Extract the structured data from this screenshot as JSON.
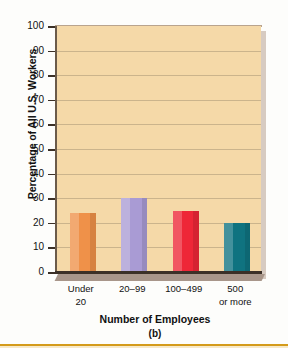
{
  "chart_data": {
    "type": "bar",
    "title": "",
    "categories": [
      "Under 20",
      "20–99",
      "100–499",
      "500 or more"
    ],
    "category_lines": [
      [
        "Under",
        "20"
      ],
      [
        "20–99",
        ""
      ],
      [
        "100–499",
        ""
      ],
      [
        "500",
        "or more"
      ]
    ],
    "values": [
      24,
      30,
      25,
      20
    ],
    "bar_colors": [
      "#ef9149",
      "#a99bd4",
      "#ee2737",
      "#0f7380"
    ],
    "xlabel": "Number of Employees",
    "ylabel": "Percentage of All U.S. Workers",
    "ylim": [
      0,
      100
    ],
    "ytick_step": 10,
    "yticks": [
      100,
      90,
      80,
      70,
      60,
      50,
      40,
      30,
      20,
      10,
      0
    ],
    "ytick_labels": [
      "100",
      "90",
      "80",
      "70",
      "60",
      "50",
      "40",
      "30",
      "20",
      "10",
      "0"
    ],
    "grid": true,
    "legend": "none",
    "caption": "(b)",
    "plot_background": "#f5d9a8",
    "grid_color": "#cbb48c",
    "axis_color": "#3b3027"
  },
  "figure": {
    "caption": "(b)",
    "ylabel": "Percentage of All U.S. Workers",
    "xlabel": "Number of Employees"
  }
}
